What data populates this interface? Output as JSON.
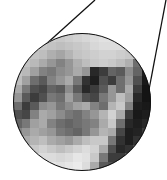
{
  "lens": {
    "center": [
      82,
      102
    ],
    "radius": 69,
    "cell_size": 8.6,
    "cols": 16,
    "rows": 16,
    "pixels": [
      [
        220,
        220,
        215,
        210,
        205,
        200,
        205,
        210,
        215,
        220,
        225,
        225,
        225,
        225,
        225,
        225
      ],
      [
        215,
        210,
        205,
        200,
        195,
        190,
        195,
        200,
        205,
        215,
        220,
        220,
        220,
        220,
        215,
        215
      ],
      [
        205,
        200,
        195,
        190,
        175,
        165,
        180,
        195,
        200,
        205,
        210,
        210,
        205,
        200,
        190,
        180
      ],
      [
        200,
        195,
        185,
        170,
        150,
        130,
        150,
        175,
        190,
        200,
        205,
        200,
        190,
        175,
        110,
        60
      ],
      [
        195,
        185,
        160,
        130,
        120,
        140,
        150,
        170,
        150,
        40,
        60,
        100,
        90,
        140,
        100,
        30
      ],
      [
        190,
        160,
        110,
        90,
        130,
        150,
        170,
        120,
        50,
        30,
        80,
        60,
        110,
        150,
        80,
        25
      ],
      [
        170,
        120,
        80,
        70,
        100,
        90,
        140,
        90,
        40,
        60,
        90,
        150,
        110,
        170,
        60,
        20
      ],
      [
        150,
        90,
        60,
        80,
        120,
        110,
        160,
        120,
        80,
        70,
        120,
        150,
        190,
        160,
        40,
        20
      ],
      [
        110,
        60,
        90,
        140,
        150,
        120,
        140,
        160,
        170,
        130,
        110,
        180,
        200,
        130,
        30,
        25
      ],
      [
        80,
        70,
        130,
        170,
        160,
        140,
        120,
        110,
        130,
        150,
        180,
        210,
        170,
        60,
        25,
        30
      ],
      [
        100,
        120,
        160,
        170,
        130,
        110,
        100,
        110,
        120,
        130,
        170,
        200,
        110,
        40,
        30,
        40
      ],
      [
        130,
        150,
        170,
        160,
        150,
        120,
        110,
        100,
        120,
        150,
        180,
        170,
        70,
        30,
        35,
        60
      ],
      [
        160,
        170,
        180,
        190,
        170,
        160,
        150,
        170,
        190,
        200,
        200,
        120,
        50,
        30,
        50,
        90
      ],
      [
        190,
        190,
        200,
        210,
        200,
        190,
        200,
        210,
        220,
        210,
        170,
        80,
        40,
        50,
        80,
        120
      ],
      [
        210,
        210,
        210,
        220,
        220,
        215,
        220,
        230,
        225,
        200,
        120,
        60,
        60,
        90,
        130,
        160
      ],
      [
        220,
        220,
        225,
        230,
        230,
        225,
        230,
        235,
        220,
        170,
        90,
        80,
        110,
        150,
        180,
        200
      ]
    ]
  },
  "lines": [
    {
      "x1": 95,
      "y1": 0,
      "x2": 44,
      "y2": 46
    },
    {
      "x1": 166,
      "y1": 0,
      "x2": 144,
      "y2": 116
    }
  ],
  "colors": {
    "line": "#111111",
    "background": "#ffffff"
  }
}
